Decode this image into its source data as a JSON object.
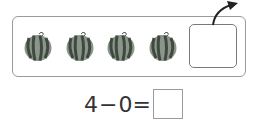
{
  "counting_frame": {
    "items": [
      {
        "icon": "watermelon-icon",
        "x": 23
      },
      {
        "icon": "watermelon-icon",
        "x": 65
      },
      {
        "icon": "watermelon-icon",
        "x": 106
      },
      {
        "icon": "watermelon-icon",
        "x": 148
      }
    ],
    "empty_slot": "",
    "arrow": "curved-arrow-up-right-icon"
  },
  "equation": {
    "left_operand": "4",
    "operator": "−",
    "right_operand": "0",
    "equals": "=",
    "answer": ""
  },
  "colors": {
    "frame_border": "#9a9a9a",
    "melon_dark": "#3f4a3f",
    "melon_light": "#8c958c",
    "text": "#333333"
  }
}
